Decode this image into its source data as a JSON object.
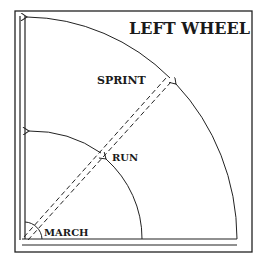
{
  "title": "LEFT WHEEL",
  "labels": {
    "march": "MARCH",
    "run": "RUN",
    "sprint": "SPRINT"
  },
  "colors": {
    "line": "#222222",
    "background": "#ffffff"
  }
}
